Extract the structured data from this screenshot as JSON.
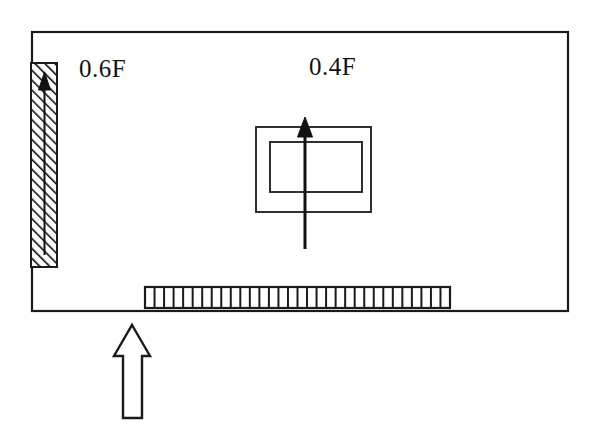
{
  "figure": {
    "type": "schematic-diagram",
    "background_color": "#ffffff",
    "stroke_color": "#1a1a1a"
  },
  "labels": [
    {
      "id": "left_flow_fraction",
      "text": "0.6F",
      "value": 0.6,
      "symbol": "F",
      "x": 79,
      "y": 56,
      "associated_with": "hatched-wall-arrow"
    },
    {
      "id": "center_flow_fraction",
      "text": "0.4F",
      "value": 0.4,
      "symbol": "F",
      "x": 309,
      "y": 54,
      "associated_with": "center-riser-arrow"
    }
  ],
  "geometry": {
    "enclosure": {
      "name": "outer-enclosure",
      "x": 32,
      "y": 32,
      "width": 536,
      "height": 279,
      "stroke_width": 2.2,
      "fill": "none"
    },
    "hatched_wall": {
      "name": "hatched-wall-block",
      "x": 31,
      "y": 63,
      "width": 26,
      "height": 204,
      "hatch_angle_deg": 45,
      "hatch_spacing": 7,
      "stroke_width": 2
    },
    "hatched_wall_arrow": {
      "name": "hatched-wall-arrow",
      "x": 44,
      "y_tail": 255,
      "y_tip": 74,
      "head_width": 13,
      "head_height": 17,
      "stem_width": 2,
      "fill": "#111111"
    },
    "nested_outer_rect": {
      "name": "center-outer-rect",
      "x": 256,
      "y": 127,
      "width": 115,
      "height": 85,
      "stroke_width": 1.8
    },
    "nested_inner_rect": {
      "name": "center-inner-rect",
      "x": 270,
      "y": 142,
      "width": 92,
      "height": 50,
      "stroke_width": 1.8
    },
    "center_arrow": {
      "name": "center-riser-arrow",
      "x": 305,
      "y_tail": 249,
      "y_tip": 118,
      "head_width": 15,
      "head_height": 19,
      "stem_width": 3,
      "fill": "#111111"
    },
    "grating": {
      "name": "bottom-grating",
      "x": 145,
      "y": 287,
      "width": 305,
      "height": 21,
      "teeth": 32,
      "stroke_width": 2
    },
    "inflow_arrow": {
      "name": "inflow-block-arrow",
      "tip_x": 132,
      "tip_y": 325,
      "shaft_left": 123,
      "shaft_right": 142,
      "head_left": 114,
      "head_right": 150,
      "head_bottom_y": 355,
      "bottom_y": 418,
      "stroke_width": 2.4,
      "fill": "none"
    }
  }
}
